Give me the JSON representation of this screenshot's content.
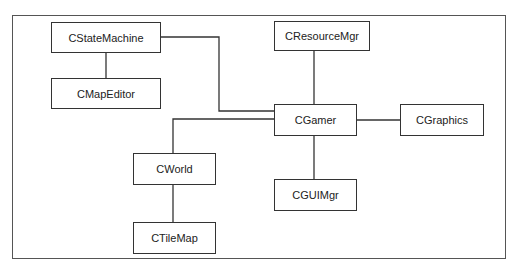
{
  "diagram": {
    "type": "class-hierarchy",
    "nodes": {
      "cstatemachine": {
        "label": "CStateMachine"
      },
      "cmapeditor": {
        "label": "CMapEditor"
      },
      "cresourcemgr": {
        "label": "CResourceMgr"
      },
      "cgamer": {
        "label": "CGamer"
      },
      "cgraphics": {
        "label": "CGraphics"
      },
      "cworld": {
        "label": "CWorld"
      },
      "cguimgr": {
        "label": "CGUIMgr"
      },
      "ctilemap": {
        "label": "CTileMap"
      }
    },
    "edges": [
      {
        "from": "CStateMachine",
        "to": "CMapEditor"
      },
      {
        "from": "CStateMachine",
        "to": "CGamer"
      },
      {
        "from": "CResourceMgr",
        "to": "CGamer"
      },
      {
        "from": "CGamer",
        "to": "CGraphics"
      },
      {
        "from": "CGamer",
        "to": "CWorld"
      },
      {
        "from": "CGamer",
        "to": "CGUIMgr"
      },
      {
        "from": "CWorld",
        "to": "CTileMap"
      }
    ],
    "colors": {
      "line": "#333333",
      "frame": "#555555",
      "background": "#ffffff"
    }
  }
}
